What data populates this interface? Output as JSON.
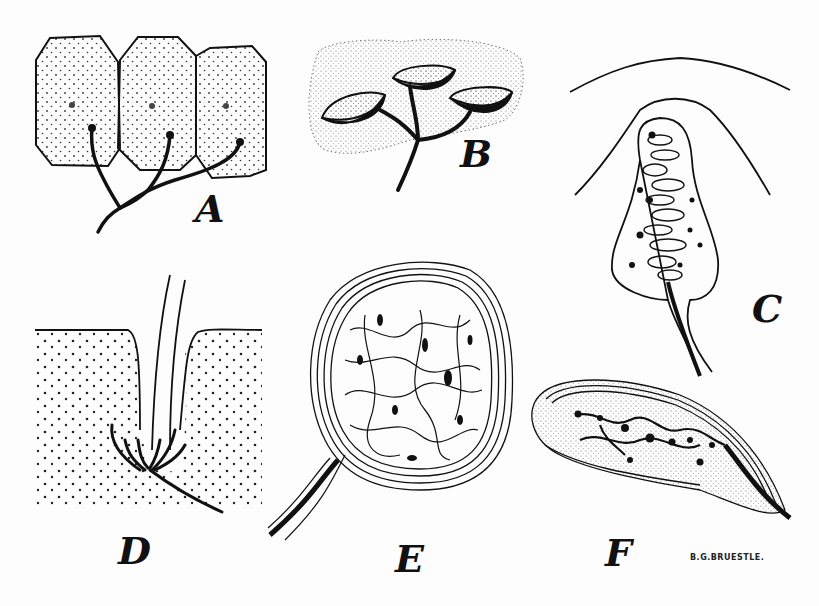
{
  "figure": {
    "panels": [
      {
        "id": "A",
        "label": "A"
      },
      {
        "id": "B",
        "label": "B"
      },
      {
        "id": "C",
        "label": "C"
      },
      {
        "id": "D",
        "label": "D"
      },
      {
        "id": "E",
        "label": "E"
      },
      {
        "id": "F",
        "label": "F"
      }
    ],
    "signature": "B.G.BRUESTLE."
  },
  "colors": {
    "ink": "#111111",
    "paper": "#fdfdfd"
  }
}
